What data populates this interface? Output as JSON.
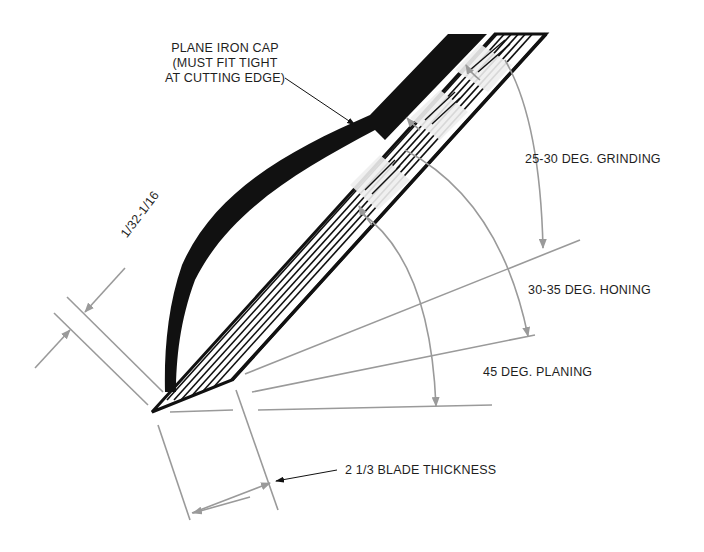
{
  "diagram": {
    "colors": {
      "ink": "#111111",
      "dimension_gray": "#9a9a9a",
      "blade_fill": "#eeeeee",
      "background": "#ffffff"
    },
    "labels": {
      "cap_line1": "PLANE IRON CAP",
      "cap_line2": "(MUST FIT TIGHT",
      "cap_line3": "AT CUTTING EDGE)",
      "cap_distance": "1/32-1/16",
      "grinding": "25-30 DEG. GRINDING",
      "honing": "30-35 DEG. HONING",
      "planing": "45 DEG. PLANING",
      "thickness": "2 1/3 BLADE THICKNESS"
    },
    "nodes": [
      {
        "id": "plane-iron-cap",
        "label": "Plane iron cap"
      },
      {
        "id": "plane-iron-blade",
        "label": "Plane iron blade"
      },
      {
        "id": "angle-grinding",
        "label": "25-30 DEG. GRINDING"
      },
      {
        "id": "angle-honing",
        "label": "30-35 DEG. HONING"
      },
      {
        "id": "angle-planing",
        "label": "45 DEG. PLANING"
      }
    ]
  }
}
